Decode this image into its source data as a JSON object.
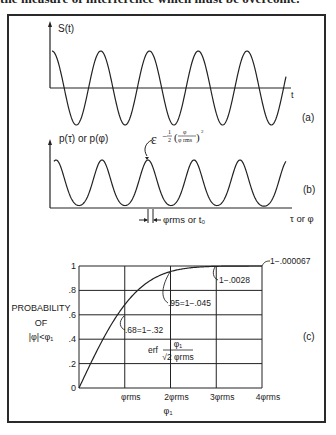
{
  "page": {
    "top_text": "the measure of interference which must be overcome."
  },
  "chart_data": [
    {
      "id": "a",
      "type": "line",
      "panel_label": "(a)",
      "title": "",
      "ylabel": "S(t)",
      "xlabel": "t",
      "description": "Sinusoidal signal S(t), approximately 5 full cycles",
      "series": [
        {
          "name": "S(t)",
          "function": "cos",
          "cycles": 4.8,
          "amplitude": 1
        }
      ],
      "grid": false
    },
    {
      "id": "b",
      "type": "line",
      "panel_label": "(b)",
      "ylabel": "p(τ) or p(φ)",
      "xlabel": "τ or φ",
      "annotation": "ε^(-1/2 (φ/φrms)^2)",
      "annotation_parts": {
        "base": "ε",
        "exp_prefix": "−",
        "frac_num": "1",
        "frac_den": "2",
        "inner_num": "φ",
        "inner_den": "φ rms",
        "power": "2"
      },
      "width_marker_label": "φrms or t₀",
      "description": "Periodic Gaussian probability density of phase jitter",
      "series": [
        {
          "name": "p(φ)",
          "shape": "gaussian-train",
          "peaks": 6
        }
      ],
      "grid": false
    },
    {
      "id": "c",
      "type": "line",
      "panel_label": "(c)",
      "ylabel_lines": [
        "PROBABILITY",
        "OF",
        "|φ|<φ₁"
      ],
      "xlabel": "φ₁",
      "yticks": [
        "0",
        ".2",
        ".4",
        ".6",
        ".8",
        "1"
      ],
      "xticks": [
        "φrms",
        "2φrms",
        "3φrms",
        "4φrms"
      ],
      "ylim": [
        0,
        1
      ],
      "xlim": [
        0,
        4
      ],
      "grid": true,
      "curve_label": {
        "prefix": "erf",
        "num": "φ₁",
        "den": "√2 φrms"
      },
      "series": [
        {
          "name": "erf(φ₁ / (√2 φrms))",
          "x": [
            0,
            0.25,
            0.5,
            0.75,
            1.0,
            1.25,
            1.5,
            1.75,
            2.0,
            2.5,
            3.0,
            3.5,
            4.0
          ],
          "y": [
            0,
            0.197,
            0.383,
            0.547,
            0.683,
            0.789,
            0.866,
            0.92,
            0.954,
            0.988,
            0.9973,
            0.9995,
            0.99994
          ]
        }
      ],
      "annotations": [
        {
          "x": 1,
          "y": 0.68,
          "text": ".68=1−.32"
        },
        {
          "x": 2,
          "y": 0.95,
          "text": ".95=1−.045"
        },
        {
          "x": 3,
          "y": 0.997,
          "text": "1−.0028"
        },
        {
          "x": 4,
          "y": 1.0,
          "text": "1−.000067"
        }
      ]
    }
  ]
}
